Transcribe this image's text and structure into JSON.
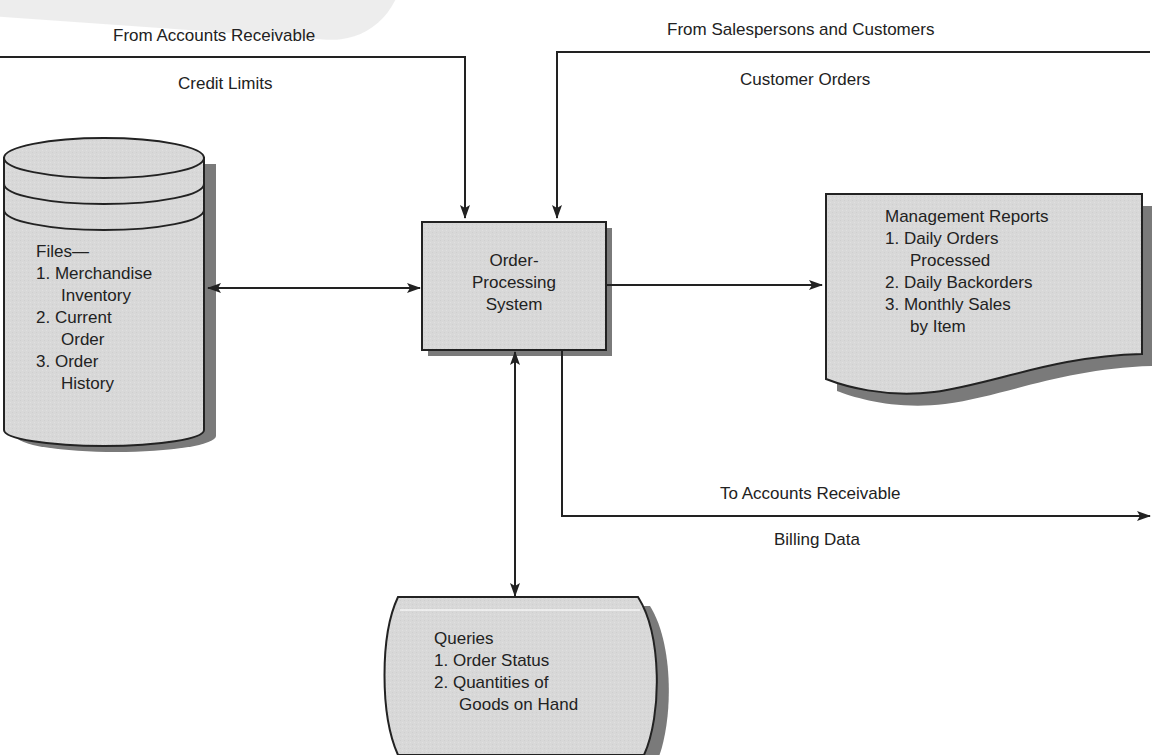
{
  "diagram": {
    "type": "system-flow-diagram",
    "title_node": {
      "lines": [
        "Order-",
        "Processing",
        "System"
      ]
    },
    "inputs": {
      "accounts_receivable": {
        "source_label": "From Accounts Receivable",
        "flow_label": "Credit Limits"
      },
      "salespersons": {
        "source_label": "From Salespersons and Customers",
        "flow_label": "Customer Orders"
      }
    },
    "files_store": {
      "heading": "Files—",
      "items": [
        {
          "num": "1.",
          "lines": [
            "Merchandise",
            "Inventory"
          ]
        },
        {
          "num": "2.",
          "lines": [
            "Current",
            "Order"
          ]
        },
        {
          "num": "3.",
          "lines": [
            "Order",
            "History"
          ]
        }
      ]
    },
    "reports_document": {
      "heading": "Management Reports",
      "items": [
        {
          "num": "1.",
          "lines": [
            "Daily Orders",
            "Processed"
          ]
        },
        {
          "num": "2.",
          "lines": [
            "Daily Backorders"
          ]
        },
        {
          "num": "3.",
          "lines": [
            "Monthly Sales",
            "by Item"
          ]
        }
      ]
    },
    "outputs": {
      "accounts_receivable": {
        "dest_label": "To Accounts Receivable",
        "flow_label": "Billing Data"
      }
    },
    "queries_display": {
      "heading": "Queries",
      "items": [
        {
          "num": "1.",
          "lines": [
            "Order Status"
          ]
        },
        {
          "num": "2.",
          "lines": [
            "Quantities of",
            "Goods on Hand"
          ]
        }
      ]
    },
    "colors": {
      "shape_fill": "#d6d6d6",
      "shape_shadow": "#7a7a7a",
      "stroke": "#222222",
      "background": "#ffffff"
    }
  }
}
